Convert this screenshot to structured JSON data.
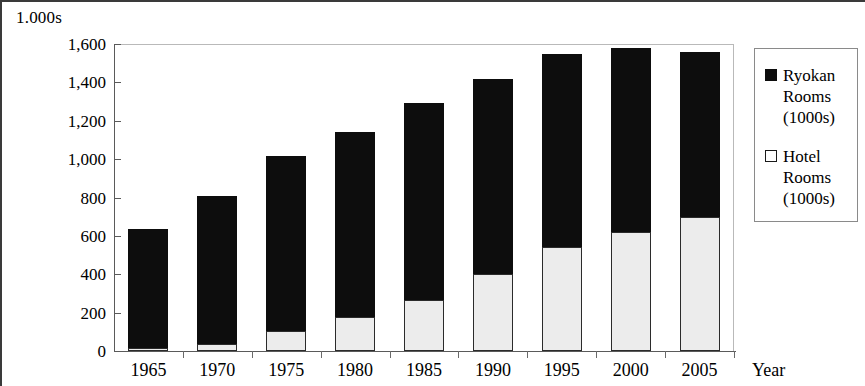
{
  "chart_data": {
    "type": "bar",
    "stacked": true,
    "title": "",
    "subtitle": "",
    "xlabel": "Year",
    "ylabel": "1.000s",
    "y_unit_caption": "1.000s",
    "categories": [
      "1965",
      "1970",
      "1975",
      "1980",
      "1985",
      "1990",
      "1995",
      "2000",
      "2005"
    ],
    "series": [
      {
        "name": "Hotel Rooms (1000s)",
        "legend_label": "Hotel\nRooms\n(1000s)",
        "marker": "open-square",
        "color": "#ececec",
        "values": [
          15,
          35,
          105,
          175,
          265,
          400,
          540,
          620,
          700
        ]
      },
      {
        "name": "Ryokan Rooms (1000s)",
        "legend_label": "Ryokan\nRooms\n(1000s)",
        "marker": "filled-square",
        "color": "#0d0d0d",
        "values": [
          620,
          775,
          910,
          965,
          1025,
          1020,
          1010,
          960,
          860
        ]
      }
    ],
    "totals": [
      635,
      810,
      1015,
      1140,
      1290,
      1420,
      1550,
      1580,
      1560
    ],
    "yticks": [
      "0",
      "200",
      "400",
      "600",
      "800",
      "1,000",
      "1,200",
      "1,400",
      "1,600"
    ],
    "ytick_values": [
      0,
      200,
      400,
      600,
      800,
      1000,
      1200,
      1400,
      1600
    ],
    "ylim": [
      0,
      1600
    ],
    "grid": false,
    "legend_position": "right"
  },
  "legend": {
    "entries": [
      {
        "label": "Ryokan\nRooms\n(1000s)",
        "marker": "filled-square"
      },
      {
        "label": "Hotel\nRooms\n(1000s)",
        "marker": "open-square"
      }
    ]
  },
  "axes": {
    "x_title": "Year",
    "y_caption": "1.000s"
  }
}
